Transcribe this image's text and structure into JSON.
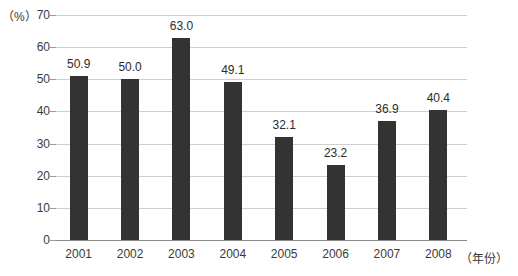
{
  "chart_data": {
    "type": "bar",
    "title": "",
    "subtitle": "",
    "xlabel": "（年份）",
    "ylabel": "（%）",
    "categories": [
      "2001",
      "2002",
      "2003",
      "2004",
      "2005",
      "2006",
      "2007",
      "2008"
    ],
    "values": [
      50.9,
      50.0,
      63.0,
      49.1,
      32.1,
      23.2,
      36.9,
      40.4
    ],
    "data_labels": [
      "50.9",
      "50.0",
      "63.0",
      "49.1",
      "32.1",
      "23.2",
      "36.9",
      "40.4"
    ],
    "ylim": [
      0,
      70
    ],
    "ytick_labels": [
      "0",
      "10",
      "20",
      "30",
      "40",
      "50",
      "60",
      "70"
    ],
    "ytick_values": [
      0,
      10,
      20,
      30,
      40,
      50,
      60,
      70
    ],
    "grid": true,
    "grid_axis": "y",
    "legend": false,
    "legend_position": "none",
    "series": [
      {
        "name": "",
        "color": "#333333",
        "values": [
          50.9,
          50.0,
          63.0,
          49.1,
          32.1,
          23.2,
          36.9,
          40.4
        ]
      }
    ],
    "annotations": []
  },
  "colors": {
    "bar": "#333333",
    "gridline": "#cfcfcf",
    "axis": "#8a8a8a",
    "text": "#2b2b2b",
    "background": "#ffffff"
  }
}
